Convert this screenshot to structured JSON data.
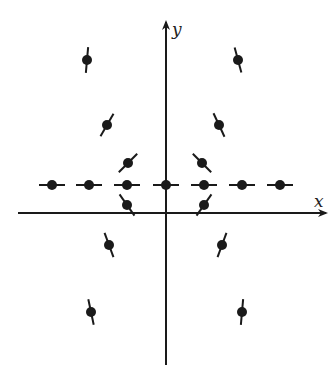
{
  "figure": {
    "type": "direction-field-diagram",
    "axes": {
      "x_label": "x",
      "y_label": "y",
      "origin_px": [
        166,
        213
      ],
      "x_axis_px": [
        18,
        326
      ],
      "y_axis_px": [
        365,
        22
      ]
    },
    "colors": {
      "ink": "#1a1a1a",
      "background": "#ffffff"
    },
    "points": [
      {
        "id": "row-1",
        "x": 52,
        "y": 185,
        "slope_deg": 0
      },
      {
        "id": "row-2",
        "x": 89,
        "y": 185,
        "slope_deg": 0
      },
      {
        "id": "row-3",
        "x": 127,
        "y": 185,
        "slope_deg": 0
      },
      {
        "id": "row-4",
        "x": 166,
        "y": 185,
        "slope_deg": 0
      },
      {
        "id": "row-5",
        "x": 204,
        "y": 185,
        "slope_deg": 0
      },
      {
        "id": "row-6",
        "x": 242,
        "y": 185,
        "slope_deg": 0
      },
      {
        "id": "row-7",
        "x": 280,
        "y": 185,
        "slope_deg": 0
      },
      {
        "id": "ul-1",
        "x": 87,
        "y": 60,
        "slope_deg": 85
      },
      {
        "id": "ul-2",
        "x": 107,
        "y": 125,
        "slope_deg": 60
      },
      {
        "id": "ul-3",
        "x": 128,
        "y": 163,
        "slope_deg": 45
      },
      {
        "id": "ur-1",
        "x": 238,
        "y": 60,
        "slope_deg": -75
      },
      {
        "id": "ur-2",
        "x": 219,
        "y": 125,
        "slope_deg": -65
      },
      {
        "id": "ur-3",
        "x": 202,
        "y": 163,
        "slope_deg": -45
      },
      {
        "id": "ll-1",
        "x": 127,
        "y": 205,
        "slope_deg": -55
      },
      {
        "id": "ll-2",
        "x": 109,
        "y": 245,
        "slope_deg": -70
      },
      {
        "id": "ll-3",
        "x": 91,
        "y": 312,
        "slope_deg": -78
      },
      {
        "id": "lr-1",
        "x": 204,
        "y": 205,
        "slope_deg": 55
      },
      {
        "id": "lr-2",
        "x": 222,
        "y": 245,
        "slope_deg": 70
      },
      {
        "id": "lr-3",
        "x": 242,
        "y": 312,
        "slope_deg": 85
      }
    ]
  }
}
